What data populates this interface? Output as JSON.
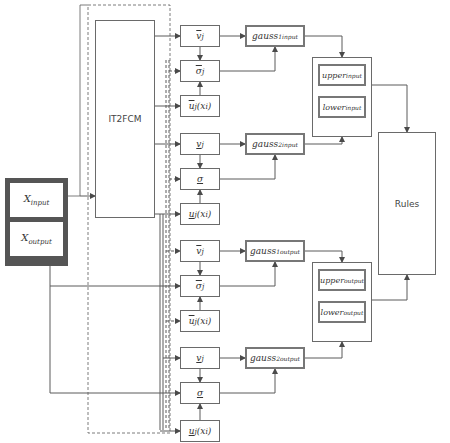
{
  "input_block": {
    "x_input": {
      "base": "X",
      "sub": "input"
    },
    "x_output": {
      "base": "X",
      "sub": "output"
    }
  },
  "it2fcm": {
    "label": "IT2FCM"
  },
  "rules": {
    "label": "Rules"
  },
  "input_branch": {
    "group1": {
      "v": {
        "base": "v",
        "sub": "j",
        "bar": "upper"
      },
      "sigma": {
        "base": "σ",
        "sub": "j",
        "bar": "upper"
      },
      "u": {
        "base": "u",
        "sub": "j",
        "arg": "(x",
        "argsub": "i",
        "close": ")",
        "bar": "upper"
      },
      "gauss": {
        "base": "gauss",
        "sub": "1",
        "sup": "input"
      }
    },
    "group2": {
      "v": {
        "base": "v",
        "sub": "j",
        "bar": "lower"
      },
      "sigma": {
        "base": "σ",
        "sub": "",
        "bar": "lower"
      },
      "u": {
        "base": "u",
        "sub": "j",
        "arg": "(x",
        "argsub": "i",
        "close": ")",
        "bar": "lower"
      },
      "gauss": {
        "base": "gauss",
        "sub": "2",
        "sup": "input"
      }
    },
    "upper": {
      "base": "upper",
      "sup": "input"
    },
    "lower": {
      "base": "lower",
      "sup": "input"
    }
  },
  "output_branch": {
    "group1": {
      "v": {
        "base": "v",
        "sub": "j",
        "bar": "upper"
      },
      "sigma": {
        "base": "σ",
        "sub": "j",
        "bar": "upper"
      },
      "u": {
        "base": "u",
        "sub": "j",
        "arg": "(x",
        "argsub": "i",
        "close": ")",
        "bar": "upper"
      },
      "gauss": {
        "base": "gauss",
        "sub": "1",
        "sup": "output"
      }
    },
    "group2": {
      "v": {
        "base": "v",
        "sub": "j",
        "bar": "lower"
      },
      "sigma": {
        "base": "σ",
        "sub": "",
        "bar": "lower"
      },
      "u": {
        "base": "u",
        "sub": "j",
        "arg": "(x",
        "argsub": "i",
        "close": ")",
        "bar": "lower"
      },
      "gauss": {
        "base": "gauss",
        "sub": "2",
        "sup": "output"
      }
    },
    "upper": {
      "base": "upper",
      "sup": "output"
    },
    "lower": {
      "base": "lower",
      "sup": "output"
    }
  },
  "colors": {
    "line": "#5a5a5a",
    "thick_border": "#777777",
    "input_block_fill": "#555555"
  }
}
